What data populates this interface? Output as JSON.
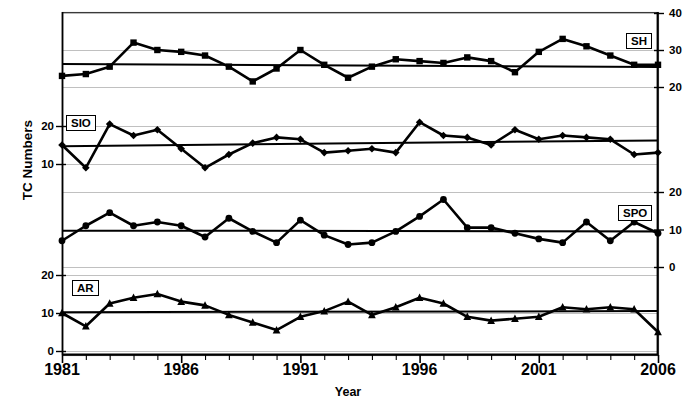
{
  "chart_data": {
    "type": "line",
    "title": "",
    "xlabel": "Year",
    "ylabel": "TC Numbers",
    "xlim": [
      1981,
      2006
    ],
    "x": [
      1981,
      1982,
      1983,
      1984,
      1985,
      1986,
      1987,
      1988,
      1989,
      1990,
      1991,
      1992,
      1993,
      1994,
      1995,
      1996,
      1997,
      1998,
      1999,
      2000,
      2001,
      2002,
      2003,
      2004,
      2005,
      2006
    ],
    "xticks_major": [
      1981,
      1986,
      1991,
      1996,
      2001,
      2006
    ],
    "xtick_labels": [
      "1981",
      "1986",
      "1991",
      "1996",
      "2001",
      "2006"
    ],
    "grid": true,
    "legend_position": "inside-panel",
    "panels": [
      {
        "name": "SH",
        "label": "SH",
        "marker": "square",
        "axis_side": "right",
        "yticks": [
          20,
          30,
          40
        ],
        "ytick_labels": [
          "20",
          "30",
          "40"
        ],
        "ylim": [
          17.5,
          41.5
        ],
        "values": [
          23.0,
          23.5,
          25.5,
          32.0,
          30.0,
          29.5,
          28.5,
          25.5,
          21.5,
          25.0,
          30.0,
          26.0,
          22.5,
          25.5,
          27.5,
          27.0,
          26.5,
          28.0,
          27.0,
          24.0,
          29.5,
          33.0,
          31.0,
          28.5,
          26.0,
          26.0
        ],
        "values_continued": [],
        "trend": {
          "start_value": 26.2,
          "end_value": 25.4
        }
      },
      {
        "name": "SIO",
        "label": "SIO",
        "marker": "diamond",
        "axis_side": "left",
        "yticks": [
          10,
          20
        ],
        "ytick_labels": [
          "10",
          "20"
        ],
        "ylim": [
          5.5,
          24.0
        ],
        "values": [
          15.0,
          9.0,
          20.5,
          17.5,
          19.0,
          14.0,
          9.0,
          12.5,
          15.5,
          17.0,
          16.5,
          13.0,
          13.5,
          14.0,
          13.0,
          21.0,
          17.5,
          17.0,
          15.0,
          19.0,
          16.5,
          17.5,
          17.0,
          16.5,
          12.5,
          13.0
        ],
        "trend": {
          "start_value": 14.7,
          "end_value": 16.2
        }
      },
      {
        "name": "SPO",
        "label": "SPO",
        "marker": "circle",
        "axis_side": "right",
        "yticks": [
          0,
          10,
          20
        ],
        "ytick_labels": [
          "0",
          "10",
          "20"
        ],
        "ylim": [
          -2.5,
          22.0
        ],
        "values": [
          7.0,
          11.0,
          14.5,
          11.0,
          12.0,
          11.0,
          8.0,
          13.0,
          9.5,
          6.5,
          12.5,
          8.5,
          6.0,
          6.5,
          9.5,
          13.5,
          18.0,
          10.5,
          10.5,
          9.0,
          7.5,
          6.5,
          12.0,
          7.0,
          12.0,
          9.0
        ],
        "trend": {
          "start_value": 9.7,
          "end_value": 9.5
        }
      },
      {
        "name": "AR",
        "label": "AR",
        "marker": "triangle",
        "axis_side": "left",
        "yticks": [
          0,
          10,
          20
        ],
        "ytick_labels": [
          "0",
          "10",
          "20"
        ],
        "ylim": [
          2.0,
          22.0
        ],
        "values": [
          10.0,
          6.5,
          12.5,
          14.0,
          15.0,
          13.0,
          12.0,
          9.5,
          7.5,
          5.5,
          9.0,
          10.5,
          13.0,
          9.5,
          11.5,
          14.0,
          12.5,
          9.0,
          8.0,
          8.5,
          9.0,
          11.5,
          11.0,
          11.5,
          11.0,
          5.0
        ],
        "trend": {
          "start_value": 10.2,
          "end_value": 10.5
        }
      }
    ]
  },
  "axes": {
    "y_title": "TC Numbers",
    "x_title": "Year"
  }
}
